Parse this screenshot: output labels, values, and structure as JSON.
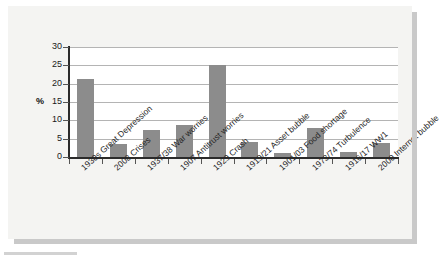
{
  "chart_data": {
    "type": "bar",
    "title": "",
    "subtitle": "",
    "xlabel": "",
    "ylabel": "%",
    "ylim": [
      0,
      30
    ],
    "yticks": [
      0,
      5,
      10,
      15,
      20,
      25,
      30
    ],
    "ytick_labels": [
      "0",
      "5",
      "10",
      "15",
      "20",
      "25",
      "30"
    ],
    "grid": true,
    "legend": false,
    "legend_position": "none",
    "bar_color": "#8c8c8c",
    "plot_background": "#ffffff",
    "panel_background": "#f4f4f2",
    "categories": [
      "1930s Great Depression",
      "2008 Crises",
      "1937/38 War worries",
      "1907 Antitrust worries",
      "1929 Crash",
      "1919/21 Asset bubble",
      "1901/03 Food shortage",
      "1973/74 Turbulence",
      "1916/17 WW1",
      "2000 Internet bubble"
    ],
    "values": [
      21.2,
      3.5,
      7.5,
      8.7,
      25.0,
      4.2,
      1.2,
      7.8,
      1.3,
      3.9
    ],
    "series": [
      {
        "name": "%",
        "values": [
          21.2,
          3.5,
          7.5,
          8.7,
          25.0,
          4.2,
          1.2,
          7.8,
          1.3,
          3.9
        ]
      }
    ]
  }
}
